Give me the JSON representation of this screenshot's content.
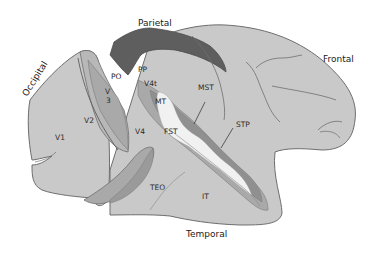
{
  "diagram": {
    "lobes": {
      "parietal": "Parietal",
      "frontal": "Frontal",
      "occipital": "Occipital",
      "temporal": "Temporal"
    },
    "areas": {
      "v1": "V1",
      "v2": "V2",
      "v3_top": "V",
      "v3_bottom": "3",
      "v4": "V4",
      "v4t": "V4t",
      "po": "PO",
      "pp": "PP",
      "mt": "MT",
      "mst": "MST",
      "fst": "FST",
      "stp": "STP",
      "teo": "TEO",
      "it": "IT"
    },
    "colors": {
      "cortex": "#c9c9c9",
      "cortex_stroke": "#6e6e6e",
      "sulcus_fill": "#a9a9a9",
      "sulcus_dark": "#8f8f8f",
      "po_band": "#5e5e5e",
      "mt_light": "#f1f1f1",
      "background": "#ffffff"
    }
  }
}
